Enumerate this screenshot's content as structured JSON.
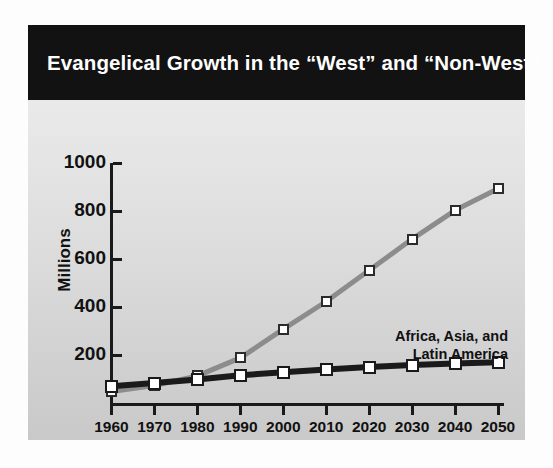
{
  "title": "Evangelical Growth in the “West” and “Non-West”",
  "chart_data": {
    "type": "line",
    "title": "Evangelical Growth in the “West” and “Non-West”",
    "xlabel": "",
    "ylabel": "Millions",
    "x": [
      1960,
      1970,
      1980,
      1990,
      2000,
      2010,
      2020,
      2030,
      2040,
      2050
    ],
    "xtick_labels": [
      "1960",
      "1970",
      "1980",
      "1990",
      "2000",
      "2010",
      "2020",
      "2030",
      "2040",
      "2050"
    ],
    "ytick_labels": [
      "200",
      "400",
      "600",
      "800",
      "1000"
    ],
    "yticks": [
      200,
      400,
      600,
      800,
      1000
    ],
    "ylim": [
      0,
      1000
    ],
    "xlim": [
      1960,
      2050
    ],
    "grid": false,
    "legend": "inline-annotations",
    "series": [
      {
        "name": "Africa, Asia, and Latin America",
        "label_lines": [
          "Africa, Asia, and",
          "Latin America"
        ],
        "color": "#8c8c8c",
        "marker": "white-square",
        "values": [
          50,
          75,
          115,
          190,
          310,
          425,
          555,
          685,
          805,
          895
        ]
      },
      {
        "name": "Europe, North America, and the Pacific",
        "label_lines": [
          "Europe, North America, and the Pacific"
        ],
        "color": "#1a1a1a",
        "marker": "white-square",
        "values": [
          72,
          85,
          100,
          118,
          130,
          142,
          152,
          160,
          167,
          172
        ]
      }
    ]
  },
  "colors": {
    "banner": "#121212",
    "banner_text": "#ffffff",
    "axis": "#1a1a1a",
    "series_nonwest": "#8c8c8c",
    "series_west": "#1a1a1a",
    "panel_top": "#f2f2f2",
    "panel_bottom": "#c9c9c9"
  }
}
